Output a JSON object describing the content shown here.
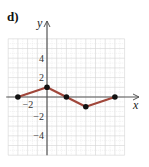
{
  "panel_label": "d)",
  "chart_data": {
    "type": "line",
    "title": "",
    "xlabel": "x",
    "ylabel": "y",
    "xlim": [
      -4,
      8
    ],
    "ylim": [
      -6,
      6
    ],
    "grid": true,
    "x_tick_labels": [
      {
        "value": -2,
        "label": "−2"
      }
    ],
    "y_tick_labels": [
      {
        "value": 4,
        "label": "4"
      },
      {
        "value": 2,
        "label": "2"
      },
      {
        "value": -2,
        "label": "−2"
      },
      {
        "value": -4,
        "label": "−4"
      }
    ],
    "series": [
      {
        "name": "piecewise",
        "color": "#a0463a",
        "points": [
          [
            -3,
            0
          ],
          [
            0,
            1
          ],
          [
            2,
            0
          ],
          [
            4,
            -1
          ],
          [
            7,
            0
          ]
        ]
      }
    ]
  }
}
